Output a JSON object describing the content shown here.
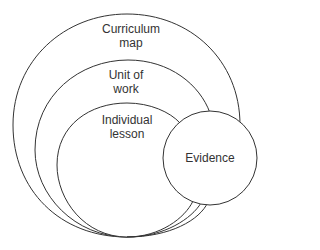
{
  "diagram": {
    "type": "nested-circles",
    "nodes": [
      {
        "id": "curriculum",
        "label_line1": "Curriculum",
        "label_line2": "map"
      },
      {
        "id": "unit",
        "label_line1": "Unit of",
        "label_line2": "work"
      },
      {
        "id": "lesson",
        "label_line1": "Individual",
        "label_line2": "lesson"
      },
      {
        "id": "evidence",
        "label": "Evidence"
      }
    ],
    "stroke_color": "#333333"
  }
}
